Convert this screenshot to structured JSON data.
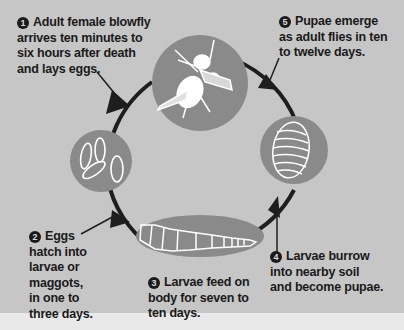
{
  "diagram": {
    "colors": {
      "background": "#c6c6c6",
      "stage_circle": "#8a8a8a",
      "line_art": "#ffffff",
      "arrow": "#1e1e1e",
      "text": "#1a1a1a",
      "footer_strip": "#e9e9e9"
    },
    "stages": [
      {
        "number": "1",
        "name": "adult-fly",
        "lines": [
          "Adult female blowfly",
          "arrives ten minutes to",
          "six hours after death",
          "and lays eggs."
        ]
      },
      {
        "number": "2",
        "name": "eggs",
        "lines": [
          "Eggs",
          "hatch into",
          "larvae or",
          "maggots,",
          "in one to",
          "three days."
        ]
      },
      {
        "number": "3",
        "name": "larvae",
        "lines": [
          "Larvae feed on",
          "body for seven to",
          "ten days."
        ]
      },
      {
        "number": "4",
        "name": "pupae",
        "lines": [
          "Larvae burrow",
          "into nearby soil",
          "and become pupae."
        ]
      },
      {
        "number": "5",
        "name": "emergence",
        "lines": [
          "Pupae emerge",
          "as adult flies in ten",
          "to twelve days."
        ]
      }
    ],
    "icons": [
      "fly-icon",
      "eggs-icon",
      "larva-icon",
      "pupa-icon"
    ]
  }
}
